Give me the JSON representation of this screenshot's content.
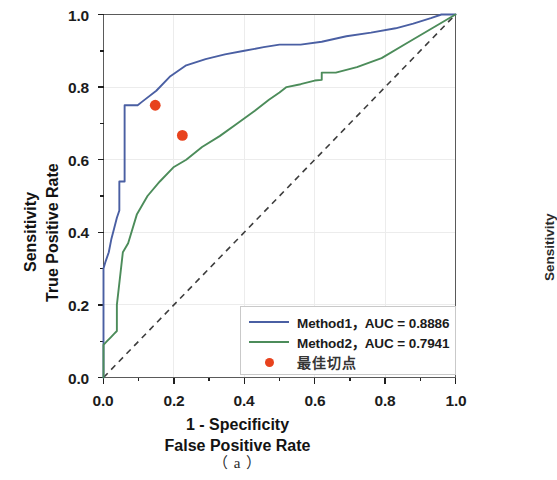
{
  "figure": {
    "caption": "（ a ）",
    "background_color": "#ffffff"
  },
  "axes": {
    "x": {
      "title_line1": "1 - Specificity",
      "title_line2": "False Positive Rate",
      "ticks": [
        "0.0",
        "0.2",
        "0.4",
        "0.6",
        "0.8",
        "1.0"
      ],
      "range": [
        0.0,
        1.0
      ]
    },
    "y": {
      "title_line1": "Sensitivity",
      "title_line2": "True Positive Rate",
      "ticks": [
        "0.0",
        "0.2",
        "0.4",
        "0.6",
        "0.8",
        "1.0"
      ],
      "range": [
        0.0,
        1.0
      ]
    },
    "right_partial_label": "Sensitivity"
  },
  "legend": {
    "items": [
      {
        "marker": "line",
        "color": "#4a5fa3",
        "label": "Method1，AUC = 0.8886"
      },
      {
        "marker": "line",
        "color": "#4c8c5a",
        "label": "Method2，AUC = 0.7941"
      },
      {
        "marker": "dot",
        "color": "#e8421d",
        "label": "最佳切点"
      }
    ]
  },
  "chart_data": {
    "type": "line",
    "title": "",
    "xlabel": "1 - Specificity / False Positive Rate",
    "ylabel": "Sensitivity / True Positive Rate",
    "xlim": [
      0.0,
      1.0
    ],
    "ylim": [
      0.0,
      1.0
    ],
    "grid": true,
    "legend_position": "lower-right",
    "series": [
      {
        "name": "Method1",
        "auc": 0.8886,
        "color": "#4a5fa3",
        "linestyle": "solid",
        "x": [
          0.0,
          0.0,
          0.006,
          0.015,
          0.022,
          0.03,
          0.038,
          0.045,
          0.045,
          0.06,
          0.06,
          0.097,
          0.11,
          0.15,
          0.19,
          0.235,
          0.29,
          0.345,
          0.4,
          0.455,
          0.5,
          0.56,
          0.62,
          0.69,
          0.76,
          0.83,
          0.88,
          0.93,
          0.96,
          1.0
        ],
        "y": [
          0.0,
          0.3,
          0.32,
          0.345,
          0.38,
          0.41,
          0.44,
          0.46,
          0.54,
          0.54,
          0.75,
          0.75,
          0.76,
          0.79,
          0.83,
          0.86,
          0.877,
          0.89,
          0.9,
          0.91,
          0.917,
          0.917,
          0.925,
          0.94,
          0.95,
          0.962,
          0.975,
          0.99,
          1.0,
          1.0
        ]
      },
      {
        "name": "Method2",
        "auc": 0.7941,
        "color": "#4c8c5a",
        "linestyle": "solid",
        "x": [
          0.0,
          0.0,
          0.01,
          0.02,
          0.03,
          0.038,
          0.038,
          0.055,
          0.07,
          0.095,
          0.125,
          0.16,
          0.2,
          0.235,
          0.28,
          0.33,
          0.38,
          0.43,
          0.47,
          0.5,
          0.52,
          0.56,
          0.6,
          0.62,
          0.62,
          0.66,
          0.72,
          0.79,
          0.86,
          0.93,
          1.0
        ],
        "y": [
          0.0,
          0.09,
          0.1,
          0.11,
          0.12,
          0.128,
          0.2,
          0.345,
          0.37,
          0.45,
          0.5,
          0.54,
          0.58,
          0.6,
          0.635,
          0.665,
          0.7,
          0.735,
          0.765,
          0.785,
          0.8,
          0.808,
          0.818,
          0.82,
          0.84,
          0.84,
          0.855,
          0.88,
          0.92,
          0.96,
          1.0
        ]
      }
    ],
    "reference_line": {
      "name": "chance-diagonal",
      "linestyle": "dashed",
      "color": "#3c3c3c",
      "x": [
        0.0,
        1.0
      ],
      "y": [
        0.0,
        1.0
      ]
    },
    "markers": [
      {
        "name": "Method1 optimal cutoff",
        "x": 0.147,
        "y": 0.75,
        "color": "#e8421d"
      },
      {
        "name": "Method2 optimal cutoff",
        "x": 0.224,
        "y": 0.667,
        "color": "#e8421d"
      }
    ]
  }
}
